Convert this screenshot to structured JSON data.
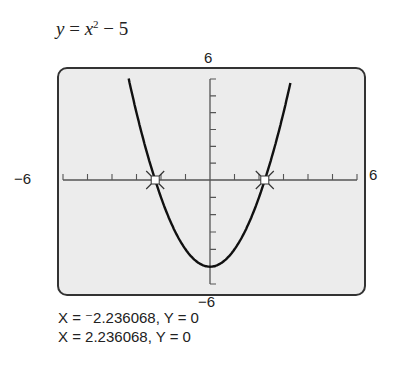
{
  "chart_data": {
    "type": "line",
    "equation": "y = x^2 - 5",
    "xlabel": "",
    "ylabel": "",
    "xlim": [
      -6,
      6
    ],
    "ylim": [
      -6,
      6
    ],
    "grid": false,
    "tick_marks": {
      "x_step": 1,
      "y_step": 1
    },
    "series": [
      {
        "name": "y = x^2 - 5",
        "x": [
          -3.3,
          -3,
          -2.5,
          -2.236068,
          -2,
          -1.5,
          -1,
          -0.5,
          0,
          0.5,
          1,
          1.5,
          2,
          2.236068,
          2.5,
          3,
          3.3
        ],
        "values": [
          5.89,
          4,
          1.25,
          0,
          -1,
          -2.75,
          -4,
          -4.75,
          -5,
          -4.75,
          -4,
          -2.75,
          -1,
          0,
          1.25,
          4,
          5.89
        ]
      }
    ],
    "annotations": [
      {
        "type": "intersect-marker",
        "x": -2.236068,
        "y": 0
      },
      {
        "type": "intersect-marker",
        "x": 2.236068,
        "y": 0
      }
    ]
  },
  "labels": {
    "title_var_y": "y",
    "title_eq": " = ",
    "title_var_x": "x",
    "title_exp": "2",
    "title_rest": " − 5",
    "ymax": "6",
    "ymin": "−6",
    "xmin": "−6",
    "xmax": "6"
  },
  "results": [
    "X = ⁻2.236068, Y = 0",
    "X = 2.236068, Y = 0"
  ]
}
